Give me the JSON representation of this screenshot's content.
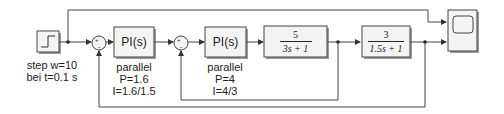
{
  "diagram": {
    "type": "simulink-block-diagram",
    "colors": {
      "line": "#444444",
      "block_border": "#444444",
      "block_fill": "#f4f4f4",
      "shadow": "#9a9a9a"
    },
    "step": {
      "label_line1": "step w=10",
      "label_line2": "bei t=0.1 s"
    },
    "sum1": {
      "signs": "+-",
      "plus": "+",
      "minus": "-"
    },
    "pi1": {
      "title": "PI(s)",
      "form": "parallel",
      "p": "P=1.6",
      "i": "I=1.6/1.5"
    },
    "sum2": {
      "signs": "+-",
      "plus": "+",
      "minus": "-"
    },
    "pi2": {
      "title": "PI(s)",
      "form": "parallel",
      "p": "P=4",
      "i": "I=4/3"
    },
    "tf1": {
      "numerator": "5",
      "denominator": "3s + 1"
    },
    "tf2": {
      "numerator": "3",
      "denominator": "1.5s + 1"
    },
    "scope": {
      "inputs": 2
    }
  }
}
